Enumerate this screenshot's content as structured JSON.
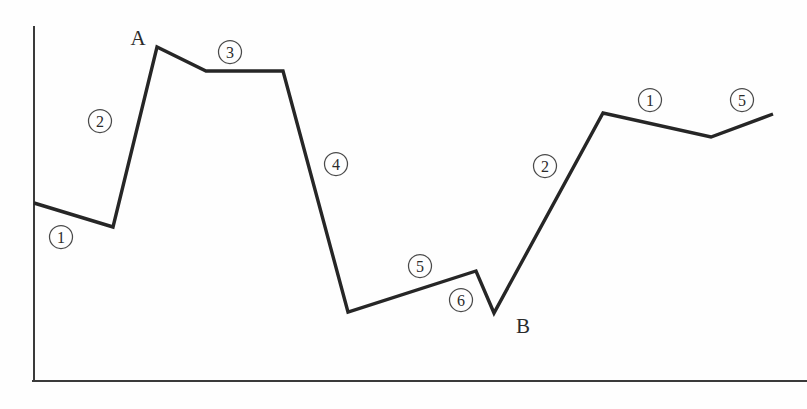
{
  "figure": {
    "background_color": "#fefefe",
    "line_color": "#262626",
    "axis_color": "#3a3a3a",
    "label_color": "#2b2b2b"
  },
  "axes": {
    "y_axis_name": "y-axis",
    "x_axis_name": "x-axis",
    "y_axis_top_px": 27,
    "y_axis_bottom_px": 381,
    "x_axis_left_px": 33,
    "x_axis_right_px": 807,
    "x_axis_y_px": 381,
    "y_axis_x_px": 34,
    "ticks_shown": false,
    "tick_labels": [],
    "grid": false
  },
  "point_labels": [
    {
      "id": "A",
      "text": "A",
      "x": 138,
      "y": 38
    },
    {
      "id": "B",
      "text": "B",
      "x": 523,
      "y": 326
    }
  ],
  "segment_labels": [
    {
      "id": "seg-1-left",
      "text": "①",
      "number": 1,
      "x": 61,
      "y": 237
    },
    {
      "id": "seg-2-left",
      "text": "②",
      "number": 2,
      "x": 100,
      "y": 121
    },
    {
      "id": "seg-3",
      "text": "③",
      "number": 3,
      "x": 230,
      "y": 52
    },
    {
      "id": "seg-4",
      "text": "④",
      "number": 4,
      "x": 336,
      "y": 164
    },
    {
      "id": "seg-5-mid",
      "text": "⑤",
      "number": 5,
      "x": 420,
      "y": 266
    },
    {
      "id": "seg-6",
      "text": "⑥",
      "number": 6,
      "x": 461,
      "y": 300
    },
    {
      "id": "seg-2-right",
      "text": "②",
      "number": 2,
      "x": 545,
      "y": 166
    },
    {
      "id": "seg-1-right",
      "text": "①",
      "number": 1,
      "x": 650,
      "y": 100
    },
    {
      "id": "seg-5-right",
      "text": "⑤",
      "number": 5,
      "x": 742,
      "y": 100
    }
  ],
  "chart_data": {
    "type": "line",
    "title": "",
    "subtitle": "",
    "xlabel": "",
    "ylabel": "",
    "grid": false,
    "legend": null,
    "axis_ticks": [],
    "series": [
      {
        "name": "series-1",
        "color": "#262626",
        "points_px": [
          [
            34,
            203
          ],
          [
            113,
            227
          ],
          [
            157,
            47
          ],
          [
            206,
            71
          ],
          [
            283,
            71
          ],
          [
            348,
            312
          ],
          [
            476,
            271
          ],
          [
            494,
            313
          ],
          [
            603,
            113
          ],
          [
            711,
            137
          ],
          [
            773,
            114
          ]
        ],
        "annotated_points": [
          {
            "label": "A",
            "index": 2
          },
          {
            "label": "B",
            "index": 7
          }
        ],
        "segment_annotations": [
          "①",
          "②",
          "③",
          "④",
          "⑤",
          "⑥",
          "②",
          "①",
          "⑤"
        ]
      }
    ]
  }
}
